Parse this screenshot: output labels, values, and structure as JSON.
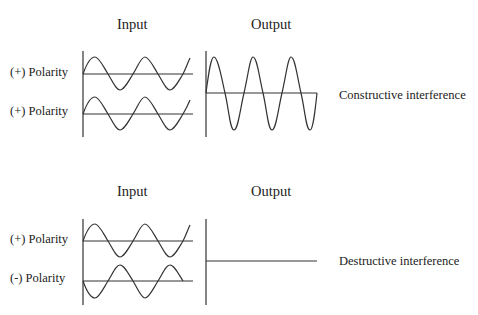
{
  "panels": [
    {
      "name": "constructive",
      "input_header": "Input",
      "output_header": "Output",
      "inputs": [
        {
          "label": "(+) Polarity"
        },
        {
          "label": "(+) Polarity"
        }
      ],
      "result_label": "Constructive  interference"
    },
    {
      "name": "destructive",
      "input_header": "Input",
      "output_header": "Output",
      "inputs": [
        {
          "label": "(+) Polarity"
        },
        {
          "label": "(-) Polarity"
        }
      ],
      "result_label": "Destructive interference"
    }
  ]
}
